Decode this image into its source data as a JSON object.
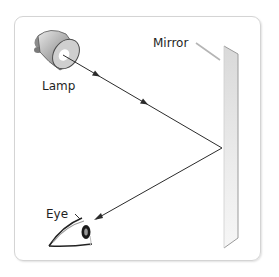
{
  "diagram": {
    "type": "light-reflection",
    "labels": {
      "lamp": "Lamp",
      "mirror": "Mirror",
      "eye": "Eye"
    },
    "rays": [
      {
        "name": "incident-ray",
        "from": "lamp",
        "to": "mirror",
        "arrows": 2
      },
      {
        "name": "reflected-ray",
        "from": "mirror",
        "to": "eye",
        "arrows": 1
      }
    ],
    "colors": {
      "ray": "#2b2b2b",
      "frame": "#d4d4d4",
      "mirror": "#e2e2e2",
      "lamp": "#9a9a9a",
      "text": "#1f1f1f"
    }
  }
}
